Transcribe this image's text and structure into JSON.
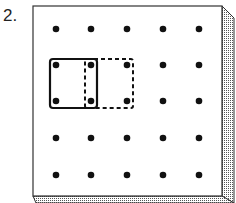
{
  "problem": {
    "number_label": "2."
  },
  "geoboard": {
    "rows": 5,
    "cols": 5,
    "peg_x": [
      56,
      91,
      127,
      163,
      199
    ],
    "peg_y": [
      29,
      65,
      101,
      138,
      175
    ],
    "board_color": "#ffffff",
    "edge_color": "#333333",
    "peg_color": "#111111"
  },
  "shapes": [
    {
      "name": "solid-square",
      "style": "solid",
      "from_peg": [
        0,
        1
      ],
      "to_peg": [
        1,
        2
      ]
    },
    {
      "name": "dashed-square",
      "style": "dashed",
      "from_peg": [
        1,
        1
      ],
      "to_peg": [
        2,
        2
      ]
    }
  ]
}
